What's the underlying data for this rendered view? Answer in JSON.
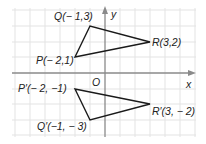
{
  "figure": {
    "axes": {
      "x_label": "x",
      "y_label": "y",
      "origin_label": "O",
      "grid": true,
      "grid_step": 1,
      "x_range": [
        -6,
        6
      ],
      "y_range": [
        -4,
        4
      ]
    },
    "triangle_original": {
      "name": "PQR",
      "vertices": [
        {
          "id": "P",
          "x": -2,
          "y": 1,
          "label": "P(− 2,1)"
        },
        {
          "id": "Q",
          "x": -1,
          "y": 3,
          "label": "Q(− 1,3)"
        },
        {
          "id": "R",
          "x": 3,
          "y": 2,
          "label": "R(3,2)"
        }
      ]
    },
    "triangle_image": {
      "name": "P'Q'R'",
      "vertices": [
        {
          "id": "P'",
          "x": -2,
          "y": -1,
          "label": "P′(− 2, −1)"
        },
        {
          "id": "Q'",
          "x": -1,
          "y": -3,
          "label": "Q′(−1, − 3)"
        },
        {
          "id": "R'",
          "x": 3,
          "y": -2,
          "label": "R′(3, − 2)"
        }
      ]
    },
    "colors": {
      "grid": "#e3e3e3",
      "axis": "#8a8a8a",
      "triangle": "#1a1a1a",
      "text": "#222222"
    }
  }
}
